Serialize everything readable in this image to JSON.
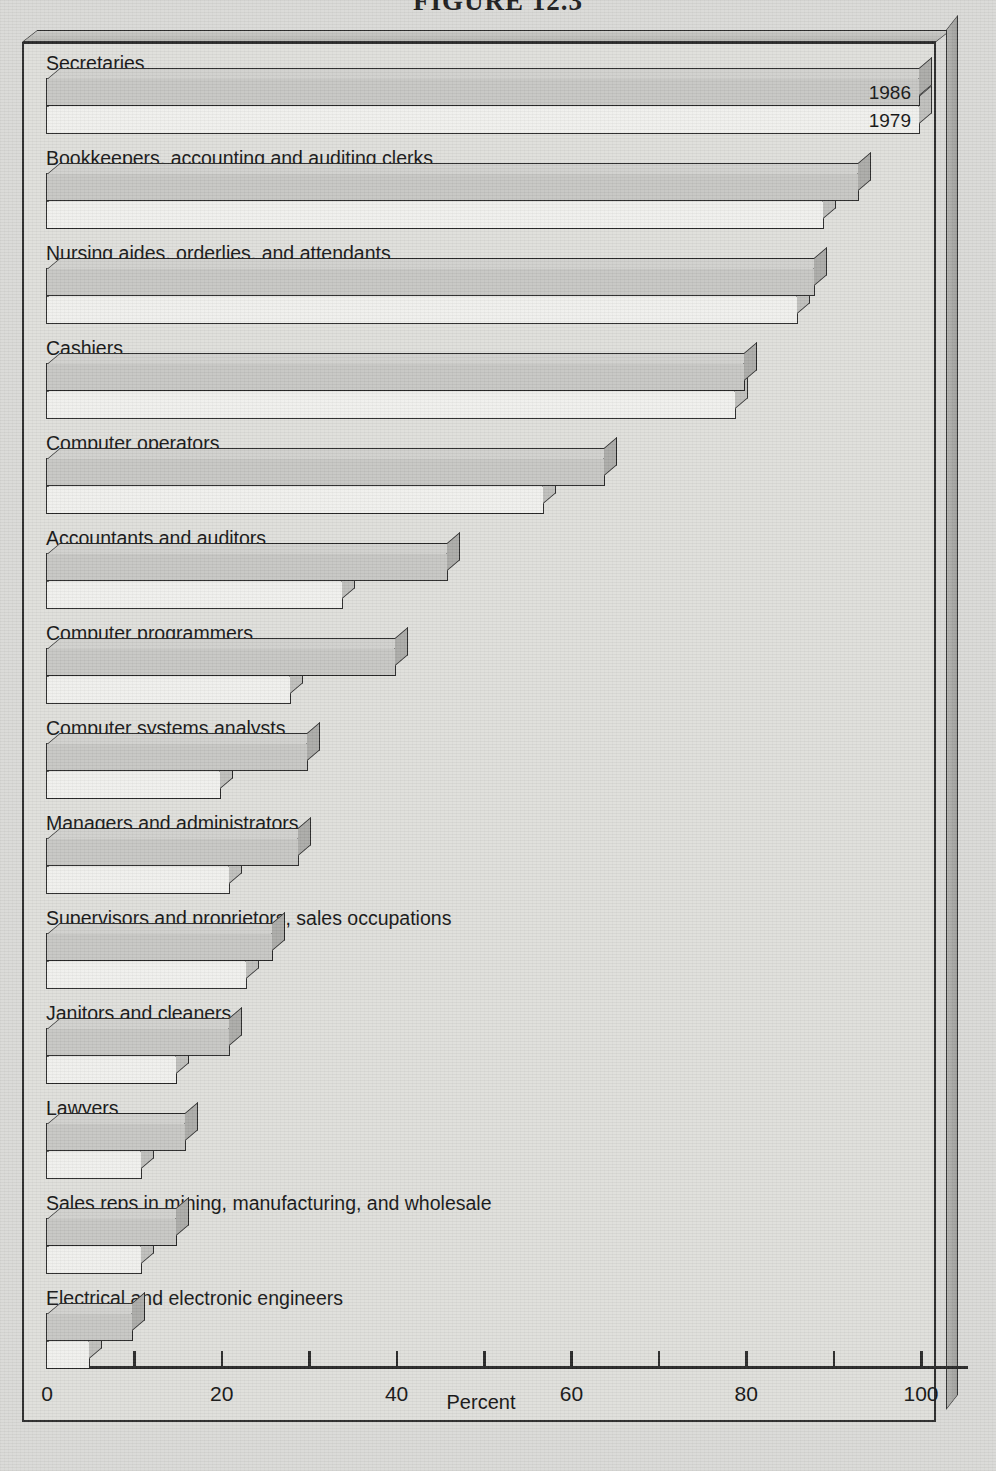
{
  "figure": {
    "caption": "FIGURE 12.3"
  },
  "chart_data": {
    "type": "bar",
    "orientation": "horizontal",
    "title": "FIGURE 12.3",
    "xlabel": "Percent",
    "ylabel": "",
    "xlim": [
      0,
      105
    ],
    "xticks": [
      0,
      10,
      20,
      30,
      40,
      50,
      60,
      70,
      80,
      90,
      100
    ],
    "xticklabels": [
      "0",
      "",
      "20",
      "",
      "40",
      "",
      "60",
      "",
      "80",
      "",
      "100"
    ],
    "grid": false,
    "legend_position": "inside-first-bars",
    "legend": [
      "1986",
      "1979"
    ],
    "categories": [
      "Secretaries",
      "Bookkeepers, accounting and auditing clerks",
      "Nursing aides, orderlies, and attendants",
      "Cashiers",
      "Computer operators",
      "Accountants and auditors",
      "Computer programmers",
      "Computer systems analysts",
      "Managers and administrators",
      "Supervisors and proprietors, sales occupations",
      "Janitors and cleaners",
      "Lawyers",
      "Sales reps in mining, manufacturing, and wholesale",
      "Electrical and electronic engineers"
    ],
    "series": [
      {
        "name": "1986",
        "values": [
          100,
          93,
          88,
          80,
          64,
          46,
          40,
          30,
          29,
          26,
          21,
          16,
          15,
          10
        ]
      },
      {
        "name": "1979",
        "values": [
          100,
          89,
          86,
          79,
          57,
          34,
          28,
          20,
          21,
          23,
          15,
          11,
          11,
          5
        ]
      }
    ]
  }
}
